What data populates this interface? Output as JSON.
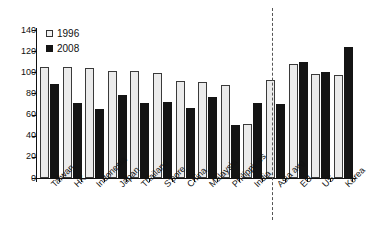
{
  "chart_data": {
    "type": "bar",
    "title": "",
    "subtitle": "",
    "xlabel": "",
    "ylabel": "",
    "ylim": [
      0,
      140
    ],
    "ytick_labels": [
      "0",
      "20",
      "40",
      "60",
      "80",
      "100",
      "120",
      "140"
    ],
    "yticks": [
      0,
      20,
      40,
      60,
      80,
      100,
      120,
      140
    ],
    "grid": false,
    "legend_position": "top-left",
    "categories": [
      "Taiwan",
      "HK",
      "Indonesia",
      "Japan",
      "Thailand",
      "S'pore",
      "China",
      "Malaysia",
      "Philippines",
      "India",
      "Asia avg",
      "EU",
      "US",
      "Korea"
    ],
    "series": [
      {
        "name": "1996",
        "color": "#ebebeb",
        "values": [
          105,
          105,
          104,
          101,
          101,
          99.5,
          92,
          91,
          88,
          51,
          93,
          107.5,
          98,
          97
        ]
      },
      {
        "name": "2008",
        "color": "#141414",
        "values": [
          89,
          71,
          65,
          79,
          71,
          71.5,
          66,
          77,
          50,
          71,
          70,
          110,
          100,
          124
        ]
      }
    ],
    "annotations": [
      {
        "name": "divider",
        "type": "vertical-dashed-line",
        "after_category": "Asia avg",
        "label": ""
      }
    ]
  },
  "legend": {
    "items": [
      {
        "label": "1996",
        "swatch": "open-square-icon"
      },
      {
        "label": "2008",
        "swatch": "filled-square-icon"
      }
    ]
  }
}
